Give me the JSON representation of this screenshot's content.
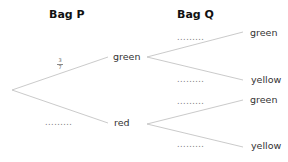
{
  "headers": {
    "bag_p": "Bag P",
    "bag_q": "Bag Q"
  },
  "bag_p": {
    "green": {
      "label": "green",
      "probability_num": "3",
      "probability_den": "7"
    },
    "red": {
      "label": "red",
      "probability": "........."
    }
  },
  "bag_q": {
    "after_green": {
      "green": {
        "label": "green",
        "probability": "........."
      },
      "yellow": {
        "label": "yellow",
        "probability": "........."
      }
    },
    "after_red": {
      "green": {
        "label": "green",
        "probability": "........."
      },
      "yellow": {
        "label": "yellow",
        "probability": "........."
      }
    }
  },
  "colors": {
    "line": "#b8b8b8",
    "text": "#333333"
  }
}
